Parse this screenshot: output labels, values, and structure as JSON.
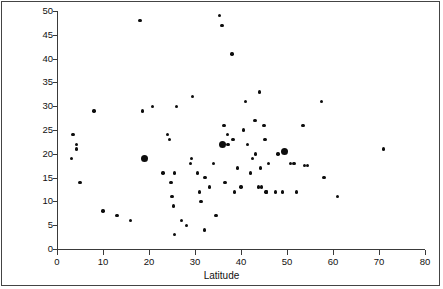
{
  "figure": {
    "background_color": "#ffffff",
    "axis_color": "#3a3a3a",
    "point_color": "#0d0d0d",
    "frame": true
  },
  "chart_data": {
    "type": "scatter",
    "title": "",
    "xlabel": "Latitude",
    "ylabel": "Penicillia as percent of total species",
    "xlim": [
      0,
      80
    ],
    "ylim": [
      0,
      50
    ],
    "xticks": [
      0,
      10,
      20,
      30,
      40,
      50,
      60,
      70,
      80
    ],
    "yticks": [
      0,
      5,
      10,
      15,
      20,
      25,
      30,
      35,
      40,
      45,
      50
    ],
    "xtick_labels": [
      "0",
      "10",
      "20",
      "30",
      "40",
      "50",
      "60",
      "70",
      "80"
    ],
    "ytick_labels": [
      "0",
      "5",
      "10",
      "15",
      "20",
      "25",
      "30",
      "35",
      "40",
      "45",
      "50"
    ],
    "grid": false,
    "legend": null,
    "series": [
      {
        "name": "small-markers",
        "marker": "small-filled-circle",
        "points": [
          [
            3.5,
            24.0
          ],
          [
            4.3,
            22.0
          ],
          [
            4.3,
            21.0
          ],
          [
            5.0,
            14.0
          ],
          [
            3.2,
            19.0
          ],
          [
            8.0,
            29.0
          ],
          [
            10.0,
            8.0
          ],
          [
            13.0,
            7.0
          ],
          [
            16.0,
            6.0
          ],
          [
            18.0,
            48.0
          ],
          [
            18.6,
            29.0
          ],
          [
            20.8,
            30.0
          ],
          [
            23.0,
            16.0
          ],
          [
            24.0,
            24.0
          ],
          [
            24.5,
            23.0
          ],
          [
            24.8,
            14.0
          ],
          [
            25.0,
            11.0
          ],
          [
            25.3,
            9.0
          ],
          [
            25.5,
            3.0
          ],
          [
            25.6,
            16.0
          ],
          [
            26.0,
            30.0
          ],
          [
            27.0,
            6.0
          ],
          [
            28.2,
            5.0
          ],
          [
            29.0,
            18.0
          ],
          [
            29.2,
            19.0
          ],
          [
            29.4,
            32.0
          ],
          [
            30.5,
            16.0
          ],
          [
            31.0,
            12.0
          ],
          [
            31.3,
            10.0
          ],
          [
            32.0,
            4.0
          ],
          [
            32.2,
            15.0
          ],
          [
            33.2,
            13.0
          ],
          [
            34.0,
            18.0
          ],
          [
            34.6,
            7.0
          ],
          [
            35.3,
            49.0
          ],
          [
            35.9,
            47.0
          ],
          [
            36.3,
            26.0
          ],
          [
            36.5,
            14.0
          ],
          [
            37.0,
            24.0
          ],
          [
            37.2,
            22.0
          ],
          [
            38.0,
            41.0
          ],
          [
            38.3,
            23.0
          ],
          [
            38.6,
            12.0
          ],
          [
            39.2,
            17.0
          ],
          [
            40.0,
            13.0
          ],
          [
            40.5,
            25.0
          ],
          [
            41.0,
            31.0
          ],
          [
            41.4,
            22.0
          ],
          [
            42.0,
            16.0
          ],
          [
            42.5,
            19.0
          ],
          [
            43.0,
            27.0
          ],
          [
            43.2,
            20.0
          ],
          [
            43.8,
            13.0
          ],
          [
            44.0,
            33.0
          ],
          [
            44.3,
            17.0
          ],
          [
            44.5,
            13.0
          ],
          [
            45.0,
            26.0
          ],
          [
            45.2,
            23.0
          ],
          [
            45.4,
            12.0
          ],
          [
            45.6,
            12.0
          ],
          [
            46.0,
            18.0
          ],
          [
            47.5,
            12.0
          ],
          [
            48.0,
            20.0
          ],
          [
            49.0,
            12.0
          ],
          [
            50.8,
            18.0
          ],
          [
            51.5,
            18.0
          ],
          [
            52.0,
            12.0
          ],
          [
            53.5,
            26.0
          ],
          [
            53.8,
            17.5
          ],
          [
            54.5,
            17.5
          ],
          [
            57.5,
            31.0
          ],
          [
            58.0,
            15.0
          ],
          [
            61.0,
            11.0
          ],
          [
            71.0,
            21.0
          ]
        ]
      },
      {
        "name": "large-markers",
        "marker": "large-filled-circle",
        "points": [
          [
            19.0,
            19.0
          ],
          [
            36.0,
            22.0
          ],
          [
            49.5,
            20.5
          ]
        ]
      }
    ]
  }
}
